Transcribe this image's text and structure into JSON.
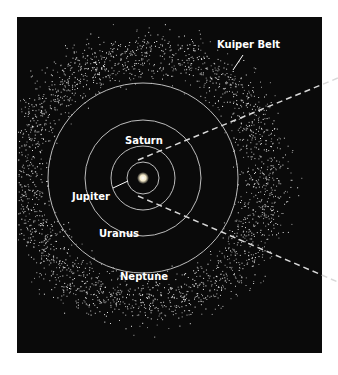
{
  "labels": {
    "kuiper": "Kuiper Belt",
    "saturn": "Saturn",
    "jupiter": "Jupiter",
    "uranus": "Uranus",
    "neptune": "Neptune"
  },
  "colors": {
    "background": "#0a0a0a",
    "orbit": "#bdbdbd",
    "text": "#ffffff",
    "dash": "#d8d8d8"
  }
}
